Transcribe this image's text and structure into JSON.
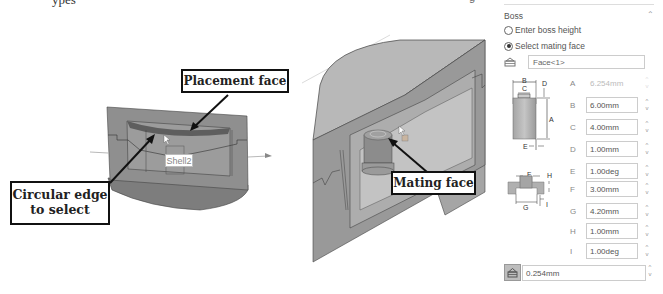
{
  "page": {
    "top_text_fragment": "ypes",
    "top_right_fragment": "g"
  },
  "left_view": {
    "callouts": {
      "placement": "Placement face",
      "circular_line1": "Circular edge",
      "circular_line2": "to select"
    },
    "tooltip": "Shell2"
  },
  "right_view": {
    "callouts": {
      "mating": "Mating face"
    }
  },
  "panel": {
    "group_title": "Boss",
    "collapse_icon": "chevron-up-icon",
    "options": [
      {
        "label": "Enter boss height",
        "checked": false
      },
      {
        "label": "Select mating face",
        "checked": true
      }
    ],
    "face_selection": {
      "icon": "face-select-icon",
      "value": "Face<1>"
    },
    "diagram1_labels": [
      "B",
      "C",
      "D",
      "A",
      "E"
    ],
    "diagram2_labels": [
      "F",
      "H",
      "G",
      "I"
    ],
    "params": [
      {
        "label": "A",
        "value": "6.254mm",
        "disabled": true
      },
      {
        "label": "B",
        "value": "6.00mm",
        "disabled": false
      },
      {
        "label": "C",
        "value": "4.00mm",
        "disabled": false
      },
      {
        "label": "D",
        "value": "1.00mm",
        "disabled": false
      },
      {
        "label": "E",
        "value": "1.00deg",
        "disabled": false
      },
      {
        "label": "F",
        "value": "3.00mm",
        "disabled": false
      },
      {
        "label": "G",
        "value": "4.20mm",
        "disabled": false
      },
      {
        "label": "H",
        "value": "1.00mm",
        "disabled": false
      },
      {
        "label": "I",
        "value": "1.00deg",
        "disabled": false
      }
    ],
    "clearance": {
      "icon": "clearance-icon",
      "value": "0.254mm"
    },
    "spinner_up": "^",
    "spinner_down": "v"
  },
  "colors": {
    "part_gray": "#8c8c8c",
    "part_light": "#b5b5b5",
    "part_dark": "#6e6e6e",
    "callout_border": "#111111"
  }
}
